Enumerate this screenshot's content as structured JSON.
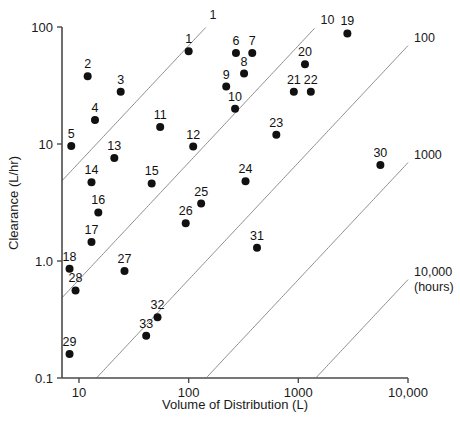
{
  "chart_data": {
    "type": "scatter",
    "title": "",
    "xlabel": "Volume of Distribution (L)",
    "ylabel": "Clearance (L/hr)",
    "xscale": "log",
    "yscale": "log",
    "xlim": [
      7,
      10000
    ],
    "ylim": [
      0.1,
      100
    ],
    "grid": false,
    "legend": "none",
    "xticks": [
      "10",
      "100",
      "1000",
      "10,000"
    ],
    "xtick_values": [
      10,
      100,
      1000,
      10000
    ],
    "yticks": [
      "100",
      "10",
      "1.0",
      "0.1"
    ],
    "ytick_values": [
      100,
      10,
      1.0,
      0.1
    ],
    "point_label_note": "numbered compounds 1-33",
    "points": [
      {
        "label": "1",
        "x": 100,
        "y": 62
      },
      {
        "label": "2",
        "x": 12,
        "y": 38
      },
      {
        "label": "3",
        "x": 24,
        "y": 28
      },
      {
        "label": "4",
        "x": 14,
        "y": 16
      },
      {
        "label": "5",
        "x": 8.5,
        "y": 9.6
      },
      {
        "label": "6",
        "x": 270,
        "y": 60
      },
      {
        "label": "7",
        "x": 380,
        "y": 60
      },
      {
        "label": "8",
        "x": 320,
        "y": 40
      },
      {
        "label": "9",
        "x": 220,
        "y": 31
      },
      {
        "label": "10",
        "x": 265,
        "y": 20
      },
      {
        "label": "11",
        "x": 55,
        "y": 14
      },
      {
        "label": "12",
        "x": 110,
        "y": 9.5
      },
      {
        "label": "13",
        "x": 21,
        "y": 7.6
      },
      {
        "label": "14",
        "x": 13,
        "y": 4.7
      },
      {
        "label": "15",
        "x": 46,
        "y": 4.6
      },
      {
        "label": "16",
        "x": 15,
        "y": 2.6
      },
      {
        "label": "17",
        "x": 13,
        "y": 1.45
      },
      {
        "label": "18",
        "x": 8.2,
        "y": 0.86
      },
      {
        "label": "19",
        "x": 2800,
        "y": 88
      },
      {
        "label": "20",
        "x": 1150,
        "y": 48
      },
      {
        "label": "21",
        "x": 910,
        "y": 28
      },
      {
        "label": "22",
        "x": 1300,
        "y": 28
      },
      {
        "label": "23",
        "x": 630,
        "y": 12
      },
      {
        "label": "24",
        "x": 330,
        "y": 4.8
      },
      {
        "label": "25",
        "x": 130,
        "y": 3.1
      },
      {
        "label": "26",
        "x": 94,
        "y": 2.1
      },
      {
        "label": "27",
        "x": 26,
        "y": 0.82
      },
      {
        "label": "28",
        "x": 9.3,
        "y": 0.56
      },
      {
        "label": "29",
        "x": 8.2,
        "y": 0.16
      },
      {
        "label": "30",
        "x": 5600,
        "y": 6.6
      },
      {
        "label": "31",
        "x": 420,
        "y": 1.3
      },
      {
        "label": "32",
        "x": 52,
        "y": 0.33
      },
      {
        "label": "33",
        "x": 41,
        "y": 0.23
      }
    ],
    "iso_lines": [
      {
        "label": "1",
        "half_life_hours": 1
      },
      {
        "label": "10",
        "half_life_hours": 10
      },
      {
        "label": "100",
        "half_life_hours": 100
      },
      {
        "label": "1000",
        "half_life_hours": 1000
      },
      {
        "label": "10,000",
        "half_life_hours": 10000
      }
    ],
    "iso_unit_label": "(hours)",
    "iso_line_description": "diagonal half-life iso-lines"
  },
  "axes": {
    "x_title": "Volume of Distribution (L)",
    "y_title": "Clearance (L/hr)"
  },
  "colors": {
    "marker": "#111111",
    "axis": "#4a4a4a",
    "iso_line": "#8c8c8c",
    "text": "#1a1a1a",
    "background": "#ffffff"
  }
}
